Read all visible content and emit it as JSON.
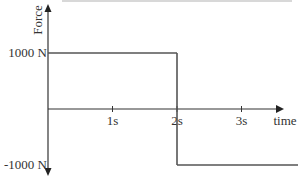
{
  "chart_data": {
    "type": "line",
    "title": "",
    "xlabel": "time",
    "ylabel": "Force",
    "x_ticks": [
      {
        "value": 1,
        "label": "1s"
      },
      {
        "value": 2,
        "label": "2s"
      },
      {
        "value": 3,
        "label": "3s"
      }
    ],
    "y_ticks": [
      {
        "value": 1000,
        "label": "1000 N"
      },
      {
        "value": -1000,
        "label": "-1000 N"
      }
    ],
    "xlim": [
      0,
      3.8
    ],
    "ylim": [
      -1100,
      1100
    ],
    "series": [
      {
        "name": "Force vs time",
        "step": true,
        "points": [
          {
            "x": 0,
            "y": 1000
          },
          {
            "x": 2,
            "y": 1000
          },
          {
            "x": 2,
            "y": -1000
          },
          {
            "x": 3.8,
            "y": -1000
          }
        ]
      }
    ],
    "grid": false,
    "legend": "none"
  },
  "colors": {
    "axis": "#333333",
    "series": "#555555"
  }
}
